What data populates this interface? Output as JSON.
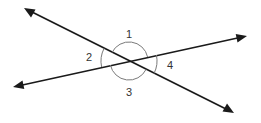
{
  "diagram": {
    "type": "intersecting-lines",
    "intersection": {
      "x": 129,
      "y": 61
    },
    "lines": [
      {
        "name": "line-a",
        "from": {
          "x": 24,
          "y": 8
        },
        "to": {
          "x": 234,
          "y": 113
        },
        "arrows": "both"
      },
      {
        "name": "line-b",
        "from": {
          "x": 13,
          "y": 87
        },
        "to": {
          "x": 247,
          "y": 36
        },
        "arrows": "both"
      }
    ],
    "angles": [
      {
        "label": "1",
        "position": "top",
        "x": 129,
        "y": 34
      },
      {
        "label": "2",
        "position": "left",
        "x": 89,
        "y": 57
      },
      {
        "label": "3",
        "position": "bottom",
        "x": 129,
        "y": 92
      },
      {
        "label": "4",
        "position": "right",
        "x": 170,
        "y": 65
      }
    ],
    "colors": {
      "line": "#1a1a1a",
      "arc": "#7a7a7a",
      "label": "#333333"
    }
  }
}
